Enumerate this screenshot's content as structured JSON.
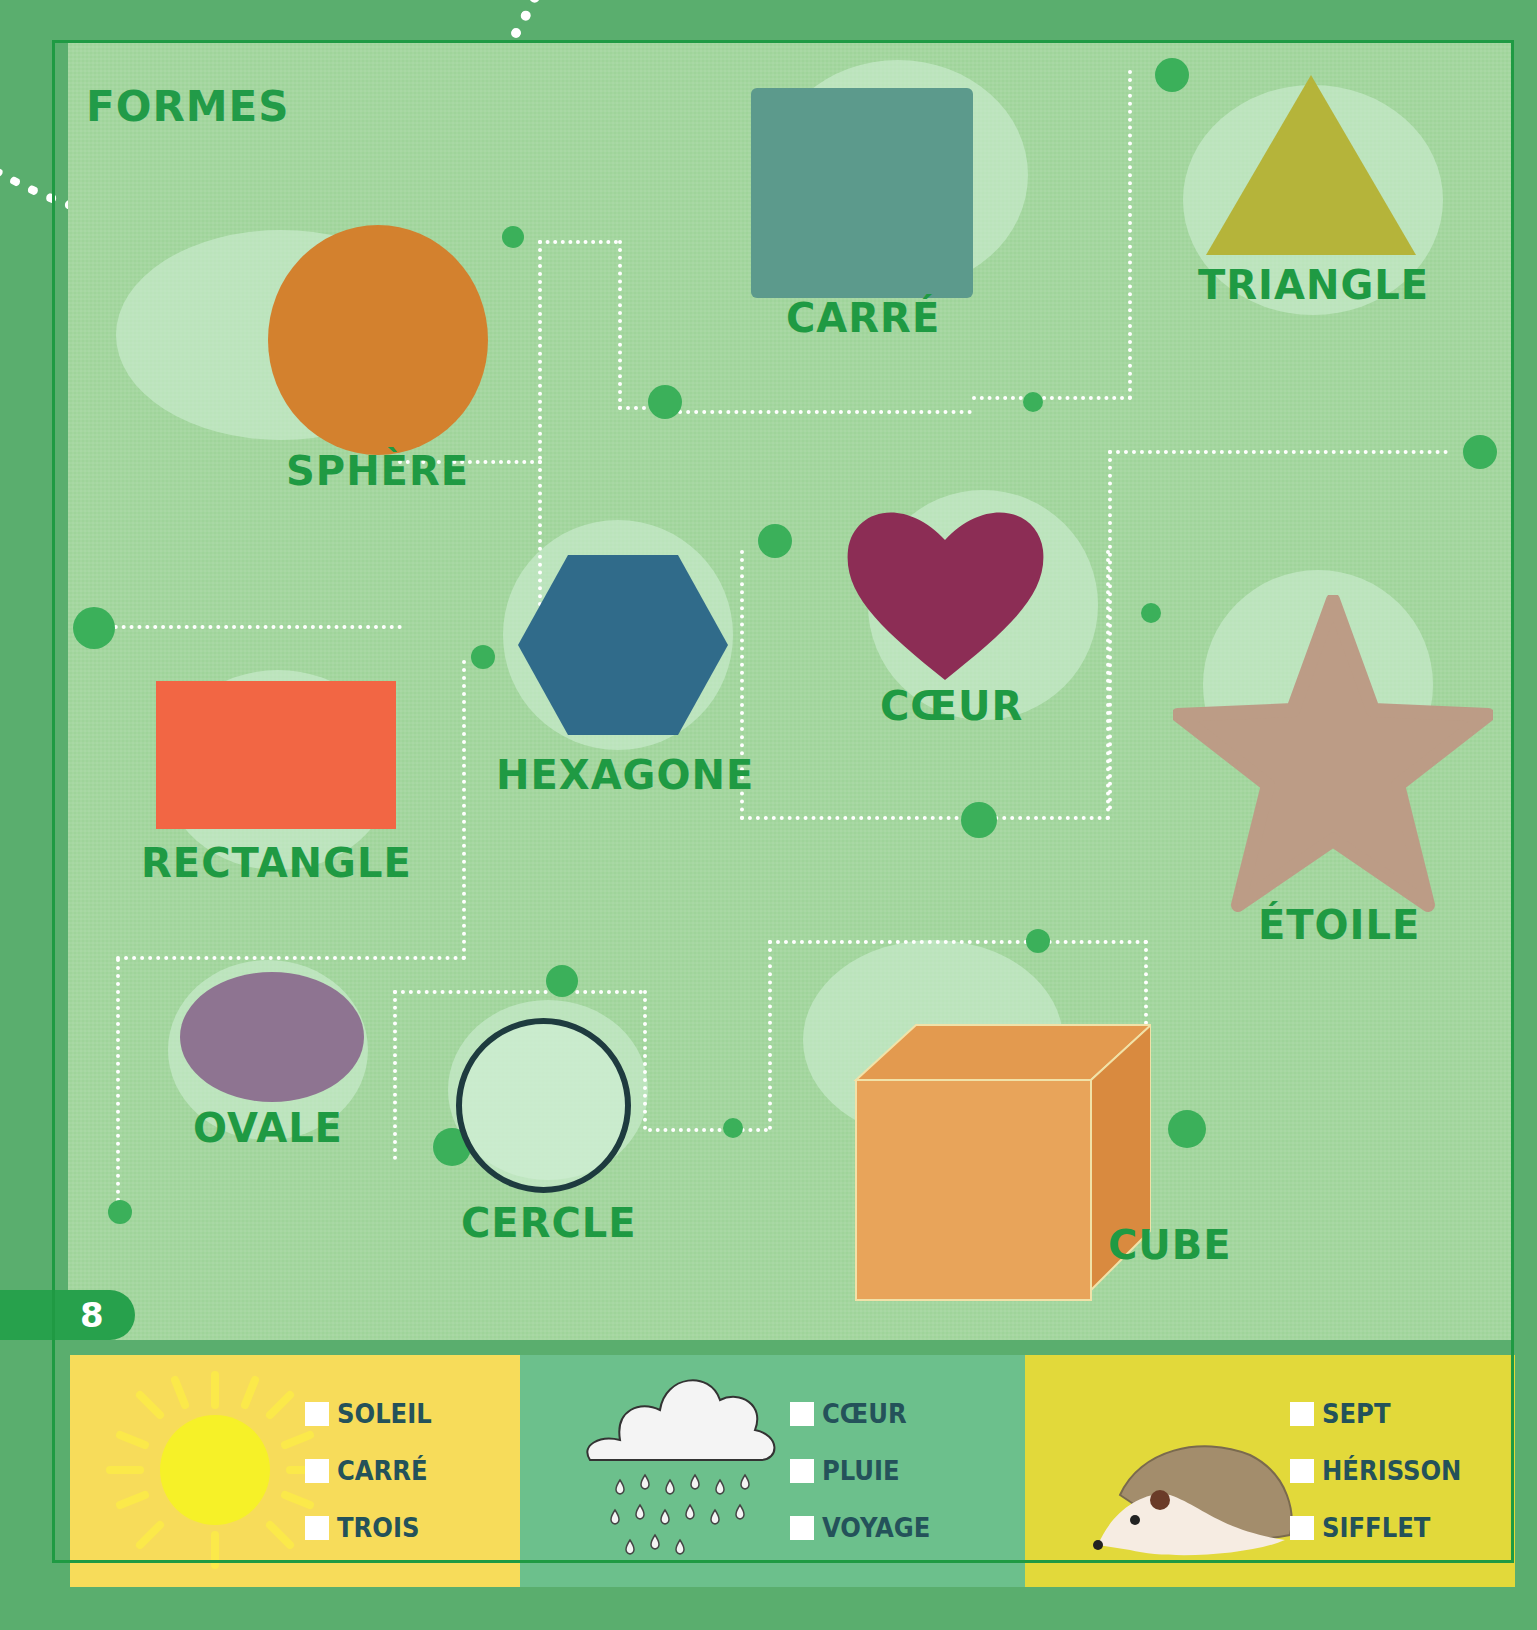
{
  "page": {
    "title": "FORMES",
    "page_number": "8"
  },
  "shapes": [
    {
      "id": "sphere",
      "label": "SPHÈRE",
      "color": "#d3812e"
    },
    {
      "id": "carre",
      "label": "CARRÉ",
      "color": "#5c9a8c"
    },
    {
      "id": "triangle",
      "label": "TRIANGLE",
      "color": "#b5b43a"
    },
    {
      "id": "hexagone",
      "label": "HEXAGONE",
      "color": "#306b8a"
    },
    {
      "id": "coeur",
      "label": "CŒUR",
      "color": "#8c2d55"
    },
    {
      "id": "etoile",
      "label": "ÉTOILE",
      "color": "#bc9c86"
    },
    {
      "id": "rectangle",
      "label": "RECTANGLE",
      "color": "#f26644"
    },
    {
      "id": "ovale",
      "label": "OVALE",
      "color": "#8e7491"
    },
    {
      "id": "cercle",
      "label": "CERCLE",
      "color": "#1e3b3f"
    },
    {
      "id": "cube",
      "label": "CUBE",
      "color": "#e8a45a"
    }
  ],
  "quiz": [
    {
      "picture": "sun-icon",
      "bg": "#f7dc5a",
      "options": [
        "SOLEIL",
        "CARRÉ",
        "TROIS"
      ]
    },
    {
      "picture": "rain-cloud-icon",
      "bg": "#6cc08c",
      "options": [
        "CŒUR",
        "PLUIE",
        "VOYAGE"
      ]
    },
    {
      "picture": "hedgehog-icon",
      "bg": "#e2d93a",
      "options": [
        "SEPT",
        "HÉRISSON",
        "SIFFLET"
      ]
    }
  ]
}
